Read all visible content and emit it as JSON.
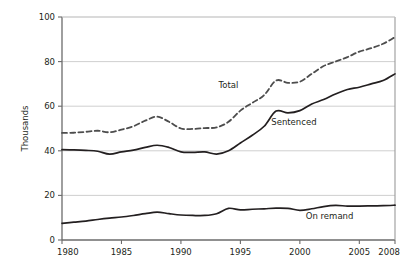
{
  "chart_data": {
    "type": "line",
    "title": "",
    "xlabel": "",
    "ylabel": "Thousands",
    "xlim": [
      1980,
      2008
    ],
    "ylim": [
      0,
      100
    ],
    "grid": "horizontal",
    "legend_position": "inline-annotations",
    "x_ticks": [
      "1980",
      "1985",
      "1990",
      "1995",
      "2000",
      "2005",
      "2008"
    ],
    "x_tick_values": [
      1980,
      1985,
      1990,
      1995,
      2000,
      2005,
      2008
    ],
    "y_ticks": [
      "0",
      "20",
      "40",
      "60",
      "80",
      "100"
    ],
    "y_tick_values": [
      0,
      20,
      40,
      60,
      80,
      100
    ],
    "x": [
      1980,
      1981,
      1982,
      1983,
      1984,
      1985,
      1986,
      1987,
      1988,
      1989,
      1990,
      1991,
      1992,
      1993,
      1994,
      1995,
      1996,
      1997,
      1998,
      1999,
      2000,
      2001,
      2002,
      2003,
      2004,
      2005,
      2006,
      2007,
      2008
    ],
    "series": [
      {
        "name": "Total",
        "style": "dashed",
        "color": "#4d4d4d",
        "label": "Total",
        "label_x": 1994.0,
        "label_y": 68.0,
        "values": [
          48.0,
          48.1,
          48.5,
          49.0,
          48.3,
          49.5,
          51.0,
          53.5,
          55.3,
          53.0,
          50.0,
          49.8,
          50.2,
          50.5,
          53.0,
          58.0,
          61.5,
          65.0,
          71.5,
          70.5,
          71.0,
          74.5,
          78.0,
          80.0,
          82.0,
          84.5,
          86.0,
          88.0,
          91.0
        ]
      },
      {
        "name": "Sentenced",
        "style": "solid",
        "color": "#231f20",
        "label": "Sentenced",
        "label_x": 1999.5,
        "label_y": 51.5,
        "values": [
          40.5,
          40.4,
          40.2,
          39.8,
          38.5,
          39.5,
          40.3,
          41.5,
          42.5,
          41.5,
          39.5,
          39.3,
          39.5,
          38.5,
          40.0,
          43.5,
          47.0,
          51.0,
          57.8,
          57.0,
          58.0,
          61.0,
          63.0,
          65.5,
          67.5,
          68.5,
          70.0,
          71.5,
          74.5
        ]
      },
      {
        "name": "On remand",
        "style": "solid",
        "color": "#231f20",
        "label": "On remand",
        "label_x": 2002.5,
        "label_y": 9.5,
        "values": [
          7.5,
          8.0,
          8.5,
          9.2,
          9.8,
          10.3,
          11.0,
          11.8,
          12.5,
          11.8,
          11.2,
          11.0,
          11.0,
          11.8,
          14.2,
          13.5,
          13.8,
          14.0,
          14.3,
          14.2,
          13.3,
          14.0,
          15.0,
          15.5,
          15.2,
          15.2,
          15.3,
          15.4,
          15.6
        ]
      }
    ]
  }
}
